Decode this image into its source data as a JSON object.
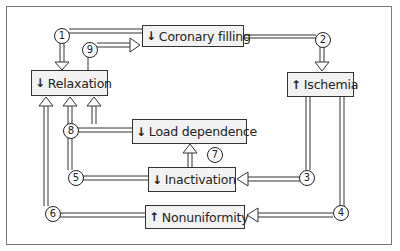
{
  "nodes": {
    "coronary_filling": {
      "direction": "↓",
      "label": "Coronary filling"
    },
    "relaxation": {
      "direction": "↓",
      "label": "Relaxation"
    },
    "ischemia": {
      "direction": "↑",
      "label": "Ischemia"
    },
    "load_dependence": {
      "direction": "↓",
      "label": "Load dependence"
    },
    "inactivation": {
      "direction": "↓",
      "label": "Inactivation"
    },
    "nonuniformity": {
      "direction": "↑",
      "label": "Nonuniformity"
    }
  },
  "links": {
    "l1": "1",
    "l2": "2",
    "l3": "3",
    "l4": "4",
    "l5": "5",
    "l6": "6",
    "l7": "7",
    "l8": "8",
    "l9": "9"
  },
  "colors": {
    "box_fill": "#f2f2f2",
    "line": "#333333",
    "frame": "#7a7a7a"
  }
}
